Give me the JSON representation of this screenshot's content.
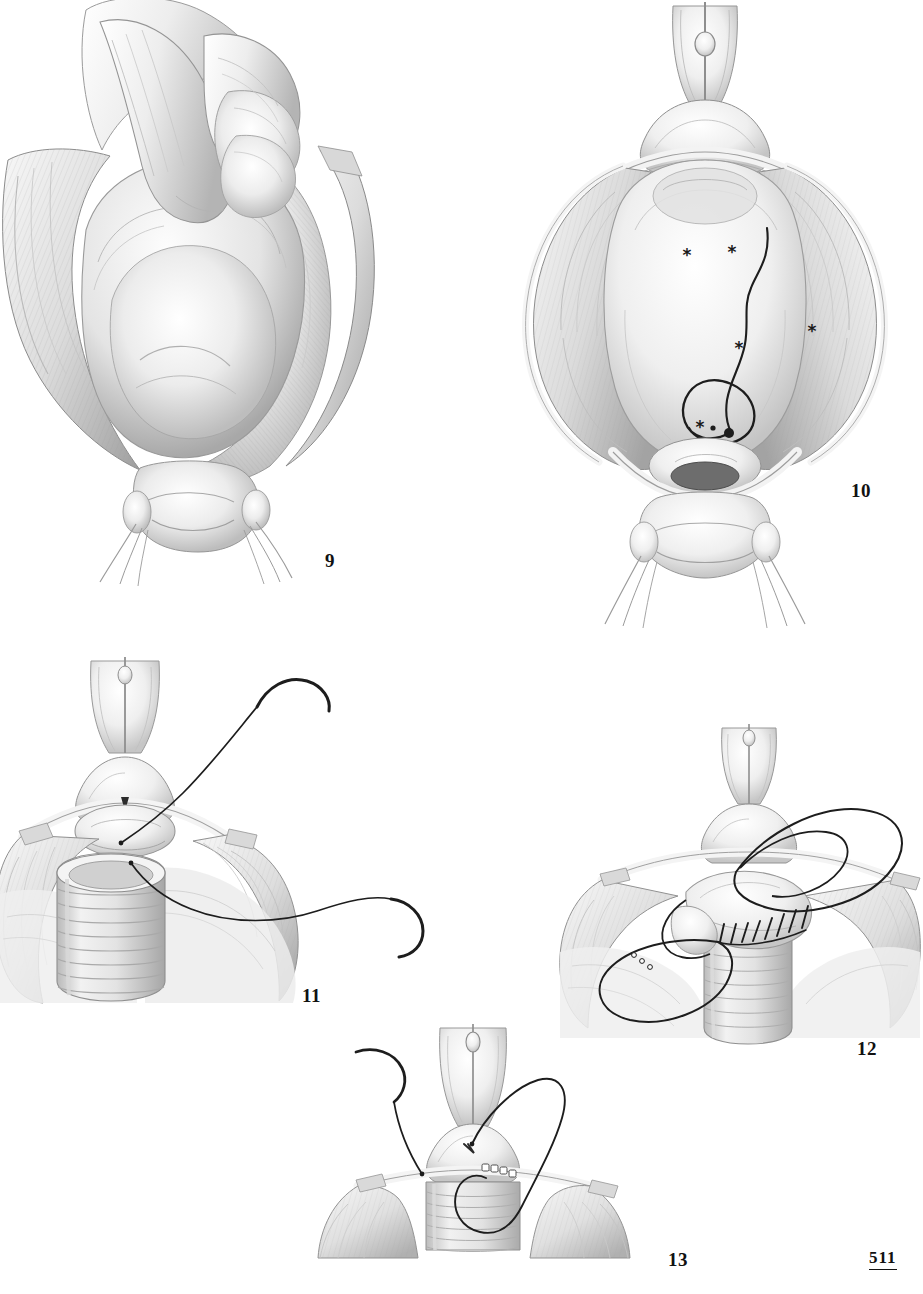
{
  "page": {
    "folio": "511",
    "background_color": "#ffffff",
    "ink_color": "#1a1a1a",
    "medium": "graphite pencil illustration",
    "width": 923,
    "height": 1294
  },
  "figures": [
    {
      "number": "9",
      "label_x": 325,
      "label_y": 551,
      "caption_subject": "surgeon's gloved hand performing digital enucleation of the prostatic adenoma through the opened bladder",
      "elements": [
        "gloved-hand",
        "index-finger",
        "thumb",
        "adenoma-lobe",
        "bladder-wall-retracted",
        "bladder-neck",
        "stay-sutures"
      ]
    },
    {
      "number": "10",
      "label_x": 851,
      "label_y": 481,
      "caption_subject": "empty prostatic fossa after enucleation, showing bleeding points marked with asterisks and a figure-of-eight haemostatic suture",
      "elements": [
        "bladder-opened",
        "prostatic-fossa",
        "bleeding-point-markers",
        "haemostatic-suture-loop",
        "suture-knot",
        "urethral-catheter",
        "bladder-neck",
        "stay-sutures"
      ],
      "marker_count": 5,
      "marker_glyph": "*"
    },
    {
      "number": "11",
      "label_x": 302,
      "label_y": 986,
      "caption_subject": "corrugated drainage tube placed in the prostatic fossa with two curved needles and suture passed through the bladder neck",
      "elements": [
        "drain-tube",
        "curved-needle-upper",
        "curved-needle-lower",
        "suture-thread",
        "bladder-neck",
        "retracted-bladder-wall"
      ]
    },
    {
      "number": "12",
      "label_x": 857,
      "label_y": 1039,
      "caption_subject": "running suture closing the bladder neck over the drainage tube, with looped suture ends held",
      "elements": [
        "running-suture-stitches",
        "suture-loop-large",
        "suture-loop-small",
        "drain-tube",
        "bladder-neck",
        "retracted-bladder-wall"
      ]
    },
    {
      "number": "13",
      "label_x": 668,
      "label_y": 1250,
      "caption_subject": "final closure of the bladder neck, needle and suture being drawn through the anterior bladder wall",
      "elements": [
        "curved-needle",
        "suture-thread",
        "closed-bladder-neck",
        "suture-beads",
        "retracted-bladder-wall",
        "urethral-catheter"
      ]
    }
  ]
}
